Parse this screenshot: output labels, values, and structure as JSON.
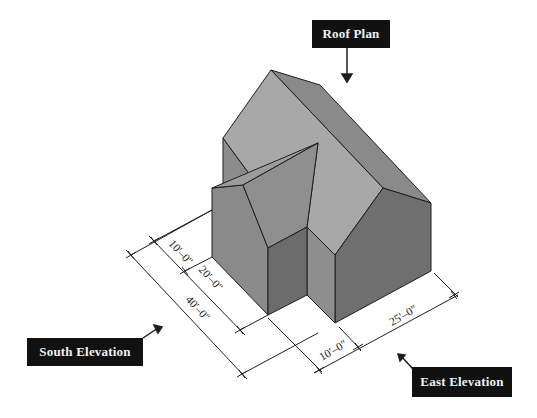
{
  "diagram": {
    "type": "isometric-building-view",
    "labels": {
      "roof_plan": "Roof Plan",
      "south_elevation": "South Elevation",
      "east_elevation": "East Elevation"
    },
    "dimensions": {
      "south_wing_offset": "10'–0\"",
      "south_wing_depth": "20'–0\"",
      "south_total": "40'–0\"",
      "east_wing_width": "10'–0\"",
      "east_main_width": "25'–0\""
    },
    "colors": {
      "label_bg": "#111111",
      "label_text": "#f2f2f2",
      "roof_light": "#a9a9a9",
      "roof_mid": "#8f8f8f",
      "wall_dark": "#6e6e6e",
      "wall_mid": "#8a8a8a",
      "outline": "#1e1e1e"
    }
  }
}
